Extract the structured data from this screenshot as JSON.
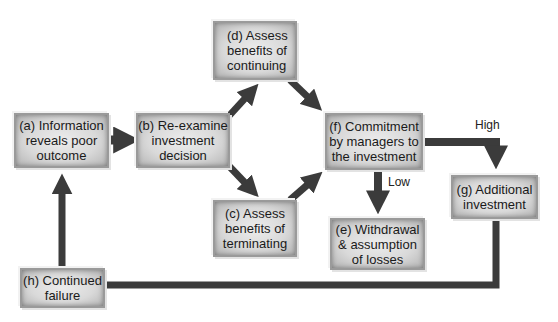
{
  "diagram": {
    "nodes": {
      "a": "(a) Information\nreveals poor\noutcome",
      "b": "(b) Re-examine\ninvestment\ndecision",
      "c": "(c) Assess\nbenefits of\nterminating",
      "d": "(d) Assess\nbenefits of\ncontinuing",
      "e": "(e) Withdrawal\n& assumption\nof losses",
      "f": "(f) Commitment\nby managers to\nthe investment",
      "g": "(g) Additional\ninvestment",
      "h": "(h) Continued\nfailure"
    },
    "edge_labels": {
      "high": "High",
      "low": "Low"
    },
    "colors": {
      "arrow": "#3b3b3b",
      "box_center": "#ececec",
      "box_edge": "#b4b4b4"
    }
  }
}
